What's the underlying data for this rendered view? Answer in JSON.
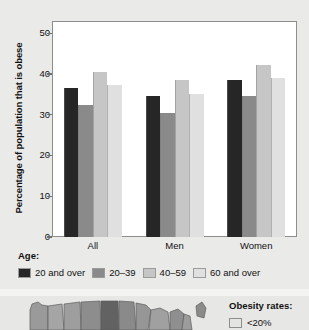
{
  "chart_data": {
    "type": "bar",
    "title": "",
    "xlabel": "",
    "ylabel": "Percentage of population that is obese",
    "ylim": [
      0,
      53
    ],
    "yticks": [
      0,
      10,
      20,
      30,
      40,
      50
    ],
    "grid": false,
    "legend_position": "below",
    "legend_title": "Age:",
    "categories": [
      "All",
      "Men",
      "Women"
    ],
    "series": [
      {
        "name": "20 and over",
        "color": "#262626",
        "values": [
          36.5,
          34.6,
          38.6
        ]
      },
      {
        "name": "20–39",
        "color": "#8a8a8a",
        "values": [
          32.4,
          30.4,
          34.6
        ]
      },
      {
        "name": "40–59",
        "color": "#c6c6c6",
        "values": [
          40.4,
          38.5,
          42.3
        ]
      },
      {
        "name": "60 and over",
        "color": "#e0e0e0",
        "values": [
          37.2,
          35.2,
          38.9
        ]
      }
    ]
  },
  "chart": {
    "y_axis_title": "Percentage of population that is obese",
    "y_tick_labels": [
      "50",
      "40",
      "30",
      "20",
      "10",
      "0"
    ],
    "x_labels": [
      "All",
      "Men",
      "Women"
    ],
    "legend": {
      "title": "Age:",
      "entries": [
        {
          "label": "20 and over",
          "color": "#262626"
        },
        {
          "label": "20–39",
          "color": "#8a8a8a"
        },
        {
          "label": "40–59",
          "color": "#c6c6c6"
        },
        {
          "label": "60 and over",
          "color": "#e0e0e0"
        }
      ]
    }
  },
  "map_panel": {
    "legend_title": "Obesity rates:",
    "legend_entries": [
      {
        "label": "<20%",
        "color": "#e4e4e2"
      }
    ]
  }
}
